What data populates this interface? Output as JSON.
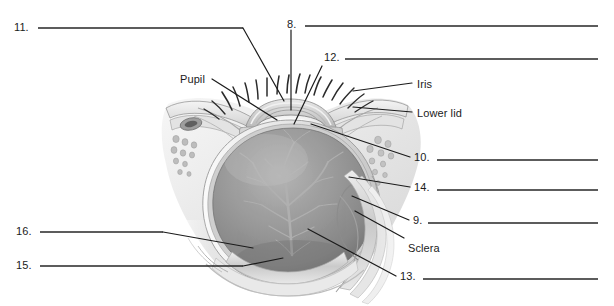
{
  "page": {
    "background_color": "#ffffff",
    "width": 614,
    "height": 306,
    "ink_color": "#1b1b1b",
    "line_color": "#262626"
  },
  "illustration": {
    "name": "sagittal-cross-section-of-human-eye",
    "style": "grayscale-pencil-shaded-medical-illustration",
    "description": "Sagittal cross-section of a human eye within the orbit, showing eyelashes, upper and lower eyelids with tarsal glands, cornea, lens, iris, anterior chamber, vitreous body with branching retinal vessels, sclera, choroid and retina layers, and extraocular tissue.",
    "palette": {
      "outline": "#4a4a4a",
      "sclera_light": "#f2f2f2",
      "tissue_mid": "#c9c9c9",
      "vitreous_dark": "#8e8e8e",
      "vitreous_darker": "#7a7a7a",
      "shadow": "#5d5d5d",
      "lens_highlight": "#fbfbfb",
      "vessel": "#9c9c9c"
    }
  },
  "labels": [
    {
      "id": "label-11",
      "text": "11.",
      "x": 14,
      "y": 22,
      "type": "numbered"
    },
    {
      "id": "label-8",
      "text": "8.",
      "x": 287,
      "y": 19,
      "type": "numbered"
    },
    {
      "id": "label-12",
      "text": "12.",
      "x": 324,
      "y": 52,
      "type": "numbered"
    },
    {
      "id": "label-pupil",
      "text": "Pupil",
      "x": 180,
      "y": 74,
      "type": "named"
    },
    {
      "id": "label-iris",
      "text": "Iris",
      "x": 417,
      "y": 79,
      "type": "named"
    },
    {
      "id": "label-lowerlid",
      "text": "Lower lid",
      "x": 417,
      "y": 108,
      "type": "named"
    },
    {
      "id": "label-10",
      "text": "10.",
      "x": 414,
      "y": 152,
      "type": "numbered"
    },
    {
      "id": "label-14",
      "text": "14.",
      "x": 414,
      "y": 182,
      "type": "numbered"
    },
    {
      "id": "label-9",
      "text": "9.",
      "x": 413,
      "y": 215,
      "type": "numbered"
    },
    {
      "id": "label-sclera",
      "text": "Sclera",
      "x": 408,
      "y": 243,
      "type": "named"
    },
    {
      "id": "label-13",
      "text": "13.",
      "x": 400,
      "y": 271,
      "type": "numbered"
    },
    {
      "id": "label-16",
      "text": "16.",
      "x": 16,
      "y": 226,
      "type": "numbered"
    },
    {
      "id": "label-15",
      "text": "15.",
      "x": 16,
      "y": 260,
      "type": "numbered"
    }
  ],
  "answer_lines": [
    {
      "id": "answer-line-11",
      "for": "11.",
      "x1": 38,
      "y1": 28,
      "x2": 243,
      "y2": 28
    },
    {
      "id": "answer-line-8",
      "for": "8.",
      "x1": 305,
      "y1": 26,
      "x2": 598,
      "y2": 26
    },
    {
      "id": "answer-line-12",
      "for": "12.",
      "x1": 345,
      "y1": 59,
      "x2": 598,
      "y2": 59
    },
    {
      "id": "answer-line-10",
      "for": "10.",
      "x1": 437,
      "y1": 160,
      "x2": 598,
      "y2": 160
    },
    {
      "id": "answer-line-14",
      "for": "14.",
      "x1": 437,
      "y1": 190,
      "x2": 598,
      "y2": 190
    },
    {
      "id": "answer-line-9",
      "for": "9.",
      "x1": 428,
      "y1": 223,
      "x2": 598,
      "y2": 223
    },
    {
      "id": "answer-line-13",
      "for": "13.",
      "x1": 423,
      "y1": 279,
      "x2": 598,
      "y2": 279
    },
    {
      "id": "answer-line-16",
      "for": "16.",
      "x1": 40,
      "y1": 232,
      "x2": 163,
      "y2": 232
    },
    {
      "id": "answer-line-15",
      "for": "15.",
      "x1": 40,
      "y1": 266,
      "x2": 243,
      "y2": 266
    }
  ],
  "leader_lines": [
    {
      "id": "leader-11",
      "for": "11.",
      "points": "243,28 284,101"
    },
    {
      "id": "leader-8",
      "for": "8.",
      "points": "291,30 291,110"
    },
    {
      "id": "leader-12",
      "for": "12.",
      "points": "322,66 294,124"
    },
    {
      "id": "leader-pupil",
      "for": "Pupil",
      "points": "212,79 277,120"
    },
    {
      "id": "leader-iris",
      "for": "Iris",
      "points": "412,83 353,91"
    },
    {
      "id": "leader-lowerlid",
      "for": "Lower lid",
      "points": "412,112 353,107"
    },
    {
      "id": "leader-10",
      "for": "10.",
      "points": "410,157 311,124"
    },
    {
      "id": "leader-14",
      "for": "14.",
      "points": "410,187 349,177"
    },
    {
      "id": "leader-9",
      "for": "9.",
      "points": "409,220 352,196"
    },
    {
      "id": "leader-sclera",
      "for": "Sclera",
      "points": "404,238 355,211"
    },
    {
      "id": "leader-13",
      "for": "13.",
      "points": "396,276 308,229"
    },
    {
      "id": "leader-16",
      "for": "16.",
      "points": "163,232 253,248"
    },
    {
      "id": "leader-15",
      "for": "15.",
      "points": "243,266 283,258"
    }
  ],
  "eyelashes": {
    "count": 17,
    "description": "fine tapered lashes radiating upward and outward from the upper lid margin"
  }
}
